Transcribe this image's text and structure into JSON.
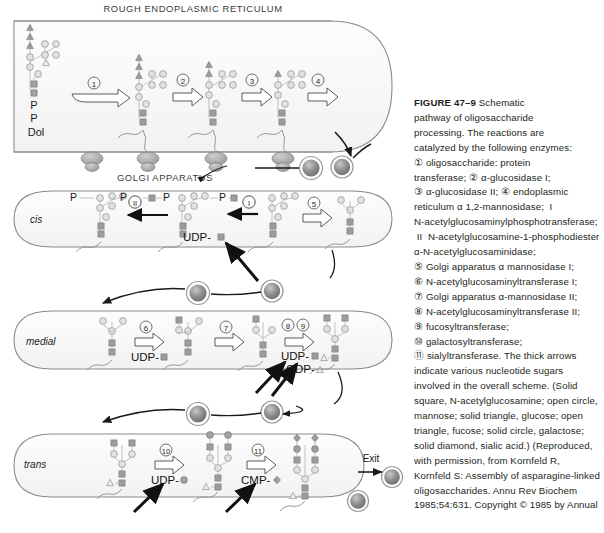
{
  "figure": {
    "compartments": {
      "er_title": "ROUGH ENDOPLASMIC RETICULUM",
      "golgi_title": "GOLGI APPARATUS",
      "cis_label": "cis",
      "medial_label": "medial",
      "trans_label": "trans",
      "exit_label": "Exit"
    },
    "er": {
      "dolichol_labels": [
        "P",
        "P",
        "Dol"
      ],
      "steps": [
        "1",
        "2",
        "3",
        "4"
      ]
    },
    "cis": {
      "steps": [
        "II",
        "I",
        "5"
      ],
      "phosphate_labels": [
        "P",
        "P",
        "P"
      ],
      "donors": [
        "UDP-"
      ]
    },
    "medial": {
      "steps": [
        "6",
        "7",
        "8",
        "9"
      ],
      "donors": [
        "UDP-",
        "UDP-",
        "GDP-"
      ]
    },
    "trans": {
      "steps": [
        "10",
        "11"
      ],
      "donors": [
        "UDP-",
        "CMP-"
      ]
    },
    "legend_symbols": {
      "solid_square": "N-acetylglucosamine",
      "open_circle": "mannose",
      "solid_triangle": "glucose",
      "open_triangle": "fucose",
      "solid_circle": "galactose",
      "solid_diamond": "sialic acid"
    }
  },
  "caption": {
    "figure_number": "FIGURE 47–9",
    "lines": [
      " Schematic",
      "pathway of oligosaccharide",
      "processing. The reactions are",
      "catalyzed by the following enzymes:",
      "① oligosaccharide: protein",
      "transferase; ② α-glucosidase I;",
      "③ α-glucosidase II; ④ endoplasmic",
      "reticulum α 1,2-mannosidase;  I",
      "N-acetylglucosaminylphosphotransferase;",
      " II  N-acetylglucosamine-1-phosphodiester",
      "α-N-acetylglucosaminidase;",
      "⑤ Golgi apparatus α mannosidase I;",
      "⑥ N-acetylglucosaminyltransferase I;",
      "⑦ Golgi apparatus α-mannosidase II;",
      "⑧ N-acetylglucosaminyltransferase II;",
      "⑨ fucosyltransferase;",
      "⑩ galactosyltransferase;",
      "⑪ sialyltransferase. The thick arrows",
      "indicate various nucleotide sugars",
      "involved in the overall scheme. (Solid",
      "square, N-acetylglucosamine; open circle,",
      "mannose; solid triangle, glucose; open",
      "triangle, fucose; solid circle, galactose;",
      "solid diamond, sialic acid.) (Reproduced,",
      "with permission, from Kornfeld R,",
      "Kornfeld S: Assembly of asparagine-linked",
      "oligosaccharides. Annu Rev Biochem",
      "1985;54:631. Copyright © 1985 by Annual",
      "Reviews. Reprinted with permission.)"
    ]
  },
  "colors": {
    "membrane": "#8a8a8a",
    "symbol_fill": "#bdbdbd",
    "symbol_dark": "#8f8f8f",
    "vesicle": "#9a9a9a",
    "text": "#231f20"
  }
}
